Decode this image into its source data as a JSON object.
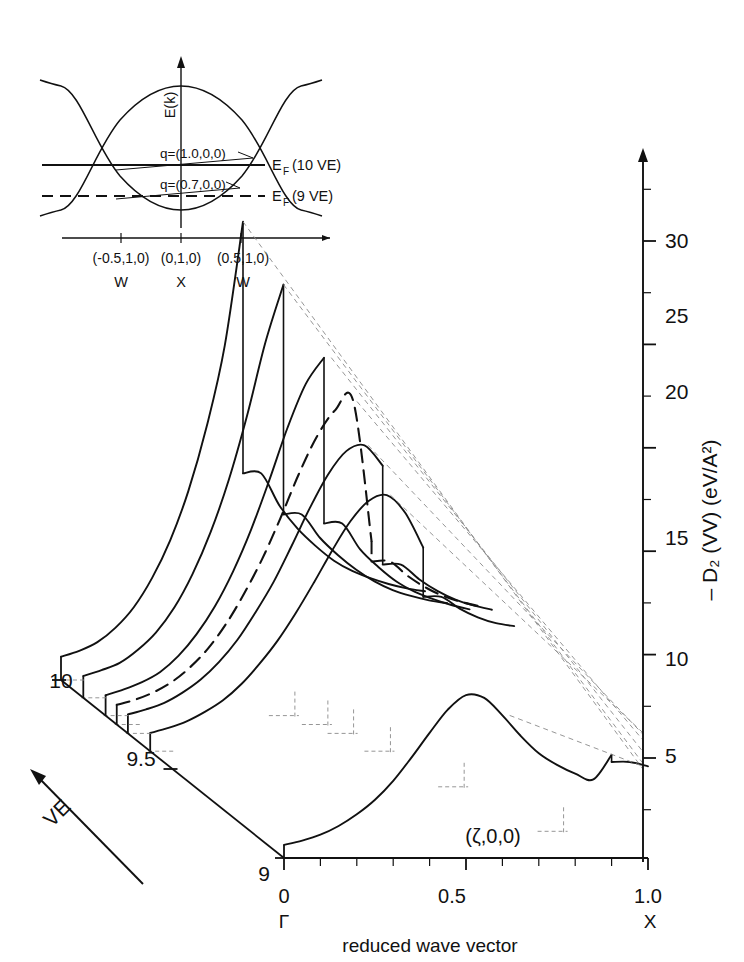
{
  "figure": {
    "kind": "3d-waterfall-plot",
    "background": "#ffffff",
    "ink": "#111111",
    "dash_color": "#8a8a8a"
  },
  "axes": {
    "x": {
      "label": "reduced wave vector",
      "ticks": [
        "0",
        "0.5",
        "1.0"
      ],
      "tick_values": [
        0,
        0.5,
        1.0
      ],
      "endpoint_symbols": [
        "Γ",
        "X"
      ],
      "gamma": "Γ",
      "x_point": "X",
      "inline_annotation": "(ζ,0,0)",
      "minor_tick_count": 10
    },
    "y": {
      "label_minus": "– D",
      "label_sub": "2",
      "label_rest": "(VV)  (eV/A",
      "label_sup": "2",
      "label_close": ")",
      "label_full": "– D₂ (VV)  (eV/A²)",
      "ticks": [
        "5",
        "10",
        "15",
        "20",
        "25",
        "30"
      ],
      "tick_values": [
        5,
        10,
        15,
        20,
        25,
        30
      ],
      "range": [
        0,
        33
      ]
    },
    "z": {
      "label": "VE",
      "ticks": [
        "9",
        "9.5",
        "10"
      ],
      "tick_values": [
        9,
        9.5,
        10
      ],
      "range": [
        9,
        10
      ]
    }
  },
  "chart_data": {
    "type": "line",
    "title": "",
    "xlabel": "reduced wave vector",
    "ylabel": "– D₂ (VV)  (eV/A²)",
    "zlabel": "VE",
    "xlim": [
      0,
      1.0
    ],
    "ylim": [
      0,
      33
    ],
    "zlim": [
      9,
      10
    ],
    "grid": false,
    "legend": "none",
    "x": [
      0.0,
      0.05,
      0.1,
      0.15,
      0.2,
      0.25,
      0.3,
      0.35,
      0.4,
      0.45,
      0.5,
      0.55,
      0.6,
      0.65,
      0.7,
      0.75,
      0.8,
      0.85,
      0.9,
      0.95,
      1.0
    ],
    "series": [
      {
        "name": "VE = 10.0",
        "ve": 10.0,
        "style": "solid",
        "peak_x": 0.5,
        "peak_sharp": true,
        "drop_x": 0.5,
        "values": [
          1.6,
          2.0,
          2.6,
          3.6,
          5.0,
          7.0,
          9.6,
          13.0,
          17.4,
          23.0,
          31.5,
          14.2,
          12.0,
          10.4,
          9.2,
          8.2,
          7.5,
          7.0,
          6.6,
          6.3,
          6.1
        ]
      },
      {
        "name": "VE = 9.9",
        "ve": 9.9,
        "style": "solid",
        "peak_x": 0.55,
        "peak_sharp": true,
        "drop_x": 0.55,
        "values": [
          1.5,
          1.9,
          2.4,
          3.3,
          4.5,
          6.2,
          8.5,
          11.4,
          15.0,
          19.4,
          24.4,
          28.4,
          12.6,
          11.0,
          9.8,
          8.8,
          8.0,
          7.4,
          7.0,
          6.7,
          6.5
        ]
      },
      {
        "name": "VE = 9.8",
        "ve": 9.8,
        "style": "solid",
        "peak_x": 0.62,
        "peak_sharp": false,
        "drop_x": 0.62,
        "values": [
          1.4,
          1.8,
          2.3,
          3.0,
          4.1,
          5.6,
          7.5,
          9.9,
          12.8,
          16.2,
          19.8,
          22.8,
          24.6,
          13.2,
          11.4,
          10.2,
          9.2,
          8.5,
          8.0,
          7.6,
          7.3
        ]
      },
      {
        "name": "VE = 9.75",
        "ve": 9.75,
        "style": "dashed",
        "peak_x": 0.66,
        "peak_sharp": false,
        "drop_x": 0.68,
        "values": [
          1.35,
          1.7,
          2.2,
          2.9,
          3.9,
          5.2,
          6.9,
          9.0,
          11.4,
          14.2,
          17.2,
          19.8,
          21.6,
          22.2,
          12.6,
          11.2,
          10.2,
          9.4,
          8.8,
          8.4,
          8.1
        ]
      },
      {
        "name": "VE = 9.7",
        "ve": 9.7,
        "style": "solid",
        "peak_x": 0.66,
        "peak_sharp": false,
        "drop_x": 0.7,
        "values": [
          1.3,
          1.65,
          2.1,
          2.8,
          3.7,
          4.9,
          6.4,
          8.3,
          10.4,
          12.9,
          15.5,
          17.8,
          19.4,
          19.8,
          18.4,
          11.6,
          10.6,
          9.8,
          9.2,
          8.8,
          8.5
        ]
      },
      {
        "name": "VE = 9.6",
        "ve": 9.6,
        "style": "solid",
        "peak_x": 0.66,
        "peak_sharp": false,
        "drop_x": 0.74,
        "values": [
          1.25,
          1.6,
          2.05,
          2.7,
          3.5,
          4.6,
          6.0,
          7.6,
          9.5,
          11.6,
          13.8,
          15.8,
          17.2,
          17.6,
          16.4,
          14.0,
          10.6,
          9.8,
          9.2,
          8.8,
          8.6
        ]
      },
      {
        "name": "VE = 9.0",
        "ve": 9.0,
        "style": "solid",
        "peak_x": 0.62,
        "peak_sharp": false,
        "drop_x": 0.88,
        "values": [
          0.9,
          1.2,
          1.6,
          2.2,
          3.0,
          4.0,
          5.3,
          6.9,
          8.6,
          10.2,
          11.2,
          11.0,
          9.8,
          8.4,
          7.2,
          6.4,
          5.8,
          5.4,
          7.1,
          6.6,
          6.3
        ]
      }
    ]
  },
  "inset": {
    "name": "band-structure-inset",
    "y_axis_label": "E(k)",
    "q_labels": [
      "q=(1.0,0,0)",
      "q=(0.7,0,0)"
    ],
    "fermi_labels": [
      "E",
      "F",
      " (10 VE)",
      " (9 VE)"
    ],
    "fermi_10": "E",
    "fermi_10_sub": "F",
    "fermi_10_rest": "(10 VE)",
    "fermi_9": "E",
    "fermi_9_sub": "F",
    "fermi_9_rest": "(9 VE)",
    "k_labels": [
      "(-0.5,1,0)",
      "(0,1,0)",
      "(0.5,1,0)"
    ],
    "k_points": [
      "W",
      "X",
      "W"
    ]
  }
}
